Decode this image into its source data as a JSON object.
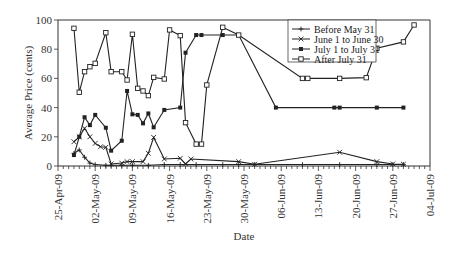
{
  "chart_data": {
    "type": "line",
    "title": "",
    "xlabel": "Date",
    "ylabel": "Average Price (cents)",
    "ylim": [
      0,
      100
    ],
    "yticks": [
      0,
      20,
      40,
      60,
      80,
      100
    ],
    "xlim": [
      "2009-04-25",
      "2009-07-04"
    ],
    "xtick_labels": [
      "25-Apr-09",
      "02-May-09",
      "09-May-09",
      "16-May-09",
      "23-May-09",
      "30-May-09",
      "06-Jun-09",
      "13-Jun-09",
      "20-Jun-09",
      "27-Jun-09",
      "04-Jul-09"
    ],
    "x_minor_tick_interval_days": 1,
    "grid": false,
    "legend_position": "top-right",
    "series": [
      {
        "name": "Before May 31",
        "marker": "plus",
        "points": [
          [
            "2009-04-28",
            8.7
          ],
          [
            "2009-04-29",
            11
          ],
          [
            "2009-04-30",
            6
          ],
          [
            "2009-05-01",
            2
          ],
          [
            "2009-05-02",
            1
          ],
          [
            "2009-05-04",
            0.5
          ],
          [
            "2009-05-05",
            0.5
          ],
          [
            "2009-05-07",
            0.5
          ],
          [
            "2009-05-09",
            0.5
          ],
          [
            "2009-05-12",
            0.5
          ],
          [
            "2009-05-15",
            1
          ],
          [
            "2009-05-18",
            1
          ],
          [
            "2009-05-21",
            1
          ],
          [
            "2009-05-26",
            1
          ],
          [
            "2009-05-29",
            1
          ],
          [
            "2009-06-01",
            1
          ],
          [
            "2009-06-10",
            1
          ],
          [
            "2009-06-17",
            1
          ],
          [
            "2009-06-24",
            1
          ],
          [
            "2009-06-27",
            1
          ],
          [
            "2009-06-29",
            1
          ]
        ]
      },
      {
        "name": "June 1 to June 30",
        "marker": "x",
        "points": [
          [
            "2009-04-28",
            16.6
          ],
          [
            "2009-04-29",
            20
          ],
          [
            "2009-04-30",
            25.8
          ],
          [
            "2009-05-01",
            20
          ],
          [
            "2009-05-02",
            15.5
          ],
          [
            "2009-05-03",
            13.2
          ],
          [
            "2009-05-04",
            12.8
          ],
          [
            "2009-05-05",
            1.4
          ],
          [
            "2009-05-07",
            2
          ],
          [
            "2009-05-08",
            3
          ],
          [
            "2009-05-09",
            3
          ],
          [
            "2009-05-11",
            3
          ],
          [
            "2009-05-12",
            8.7
          ],
          [
            "2009-05-13",
            19.6
          ],
          [
            "2009-05-15",
            4.8
          ],
          [
            "2009-05-18",
            5.3
          ],
          [
            "2009-05-19",
            1.4
          ],
          [
            "2009-05-20",
            4.8
          ],
          [
            "2009-05-29",
            3
          ],
          [
            "2009-06-01",
            1.2
          ],
          [
            "2009-06-17",
            9.4
          ],
          [
            "2009-06-24",
            3
          ],
          [
            "2009-06-27",
            1.4
          ],
          [
            "2009-06-29",
            1.2
          ]
        ]
      },
      {
        "name": "July 1 to July 31",
        "marker": "filled-square",
        "points": [
          [
            "2009-04-28",
            7.5
          ],
          [
            "2009-04-29",
            20
          ],
          [
            "2009-04-30",
            33.4
          ],
          [
            "2009-05-01",
            28
          ],
          [
            "2009-05-02",
            35
          ],
          [
            "2009-05-04",
            26.2
          ],
          [
            "2009-05-05",
            10.5
          ],
          [
            "2009-05-07",
            17.3
          ],
          [
            "2009-05-08",
            51.4
          ],
          [
            "2009-05-09",
            35.4
          ],
          [
            "2009-05-10",
            35
          ],
          [
            "2009-05-11",
            29.2
          ],
          [
            "2009-05-12",
            36
          ],
          [
            "2009-05-13",
            26.5
          ],
          [
            "2009-05-15",
            38.4
          ],
          [
            "2009-05-18",
            40
          ],
          [
            "2009-05-19",
            77.6
          ],
          [
            "2009-05-21",
            89.7
          ],
          [
            "2009-05-22",
            89.7
          ],
          [
            "2009-05-26",
            89.7
          ],
          [
            "2009-05-29",
            89.7
          ],
          [
            "2009-06-05",
            40
          ],
          [
            "2009-06-16",
            40
          ],
          [
            "2009-06-17",
            40
          ],
          [
            "2009-06-24",
            40
          ],
          [
            "2009-06-29",
            40
          ]
        ]
      },
      {
        "name": "After July 31",
        "marker": "open-square",
        "points": [
          [
            "2009-04-28",
            94.3
          ],
          [
            "2009-04-29",
            50.5
          ],
          [
            "2009-04-30",
            64.6
          ],
          [
            "2009-05-01",
            68
          ],
          [
            "2009-05-02",
            70.3
          ],
          [
            "2009-05-04",
            91.3
          ],
          [
            "2009-05-05",
            64.6
          ],
          [
            "2009-05-07",
            64.6
          ],
          [
            "2009-05-08",
            58.9
          ],
          [
            "2009-05-09",
            90.2
          ],
          [
            "2009-05-10",
            53.2
          ],
          [
            "2009-05-11",
            51.4
          ],
          [
            "2009-05-12",
            48.2
          ],
          [
            "2009-05-13",
            60.7
          ],
          [
            "2009-05-15",
            59.6
          ],
          [
            "2009-05-16",
            93.2
          ],
          [
            "2009-05-18",
            89.3
          ],
          [
            "2009-05-19",
            29.7
          ],
          [
            "2009-05-21",
            15
          ],
          [
            "2009-05-22",
            15
          ],
          [
            "2009-05-23",
            55.5
          ],
          [
            "2009-05-26",
            95
          ],
          [
            "2009-05-29",
            89.7
          ],
          [
            "2009-06-10",
            60
          ],
          [
            "2009-06-11",
            60
          ],
          [
            "2009-06-17",
            60
          ],
          [
            "2009-06-22",
            60.5
          ],
          [
            "2009-06-24",
            80.6
          ],
          [
            "2009-06-29",
            85
          ],
          [
            "2009-07-01",
            96.6
          ]
        ]
      }
    ]
  }
}
